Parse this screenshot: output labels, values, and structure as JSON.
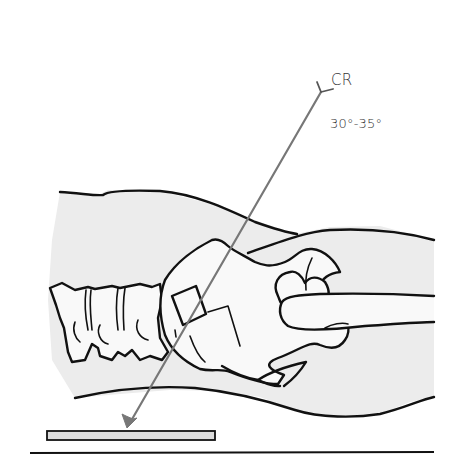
{
  "figure": {
    "central_ray_label": "CR",
    "angle_label": "30°-35°",
    "colors": {
      "ink": "#111111",
      "beam": "#777777",
      "soft_tissue": "#ececec",
      "image_receptor": "#dcdcdc",
      "background": "#ffffff"
    },
    "parts": [
      {
        "name": "central-ray",
        "icon": "arrow-icon"
      },
      {
        "name": "tube-marker",
        "icon": "y-fork-icon"
      },
      {
        "name": "body-outline"
      },
      {
        "name": "lumbar-spine"
      },
      {
        "name": "pelvis"
      },
      {
        "name": "femur"
      },
      {
        "name": "image-receptor"
      },
      {
        "name": "table-line"
      }
    ]
  }
}
